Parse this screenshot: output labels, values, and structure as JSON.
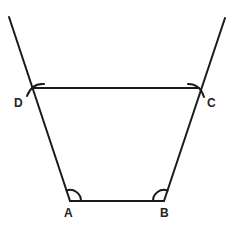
{
  "diagram": {
    "type": "geometric-construction",
    "shape": "trapezium",
    "stroke_color": "#1a1a1a",
    "points": {
      "A": {
        "label": "A",
        "x": 70,
        "y": 201
      },
      "B": {
        "label": "B",
        "x": 164,
        "y": 201
      },
      "C": {
        "label": "C",
        "x": 199,
        "y": 88
      },
      "D": {
        "label": "D",
        "x": 32,
        "y": 88
      }
    },
    "labels": [
      {
        "id": "A",
        "text": "A",
        "x": 64,
        "y": 207
      },
      {
        "id": "B",
        "text": "B",
        "x": 160,
        "y": 207
      },
      {
        "id": "C",
        "text": "C",
        "x": 207,
        "y": 97
      },
      {
        "id": "D",
        "text": "D",
        "x": 14,
        "y": 97
      }
    ],
    "rays": [
      {
        "from": "A",
        "through": "D",
        "end": {
          "x": 9,
          "y": 17
        }
      },
      {
        "from": "B",
        "through": "C",
        "end": {
          "x": 225,
          "y": 18
        }
      }
    ],
    "segments": [
      {
        "from": "A",
        "to": "B"
      },
      {
        "from": "D",
        "to": "C"
      }
    ],
    "angle_arcs": [
      "A",
      "B"
    ],
    "construction_arcs": [
      "C",
      "D"
    ]
  }
}
